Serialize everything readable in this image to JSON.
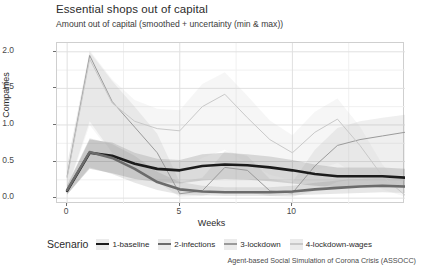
{
  "chart_data": {
    "type": "line",
    "title": "Essential shops out of capital",
    "subtitle": "Amount out of capital (smoothed + uncertainty (min & max))",
    "xlabel": "Weeks",
    "ylabel": "Companies",
    "caption": "Agent-based Social Simulation of Corona Crisis (ASSOCC)",
    "legend_title": "Scenario",
    "legend_position": "bottom",
    "grid": true,
    "xlim": [
      -0.45,
      15.0
    ],
    "ylim": [
      -0.08,
      2.12
    ],
    "xticks": [
      0,
      5,
      10
    ],
    "xtick_labels": [
      "0",
      "5",
      "10"
    ],
    "yticks": [
      0.0,
      0.5,
      1.0,
      1.5,
      2.0
    ],
    "ytick_labels": [
      "0.0",
      "0.5",
      "1.0",
      "1.5",
      "2.0"
    ],
    "x": [
      0,
      1,
      2,
      3,
      4,
      5,
      6,
      7,
      8,
      9,
      10,
      11,
      12,
      13,
      14,
      15
    ],
    "series": [
      {
        "name": "1-baseline",
        "color": "#1c1c1c",
        "width": 2.6,
        "values": [
          0.1,
          0.62,
          0.58,
          0.47,
          0.4,
          0.38,
          0.44,
          0.46,
          0.45,
          0.42,
          0.38,
          0.33,
          0.3,
          0.3,
          0.3,
          0.28
        ],
        "band_min": [
          0.05,
          0.4,
          0.34,
          0.26,
          0.22,
          0.2,
          0.24,
          0.26,
          0.25,
          0.23,
          0.2,
          0.17,
          0.15,
          0.15,
          0.15,
          0.14
        ],
        "band_max": [
          0.17,
          0.8,
          0.76,
          0.62,
          0.54,
          0.52,
          0.6,
          0.62,
          0.6,
          0.57,
          0.52,
          0.46,
          0.42,
          0.42,
          0.42,
          0.4
        ]
      },
      {
        "name": "2-infections",
        "color": "#6b6b6b",
        "width": 2.6,
        "values": [
          0.11,
          0.63,
          0.55,
          0.4,
          0.22,
          0.12,
          0.09,
          0.08,
          0.08,
          0.08,
          0.09,
          0.12,
          0.14,
          0.16,
          0.17,
          0.16
        ],
        "band_min": [
          0.05,
          0.42,
          0.33,
          0.21,
          0.11,
          0.05,
          0.04,
          0.03,
          0.03,
          0.03,
          0.04,
          0.05,
          0.06,
          0.07,
          0.08,
          0.07
        ],
        "band_max": [
          0.18,
          0.82,
          0.74,
          0.58,
          0.36,
          0.22,
          0.17,
          0.15,
          0.15,
          0.15,
          0.17,
          0.21,
          0.24,
          0.27,
          0.28,
          0.27
        ]
      },
      {
        "name": "3-lockdown",
        "color": "#9a9a9a",
        "width": 1.0,
        "values": [
          0.3,
          1.95,
          1.32,
          0.97,
          0.62,
          0.06,
          0.1,
          0.42,
          0.38,
          0.1,
          0.07,
          0.44,
          0.72,
          0.8,
          0.85,
          0.9
        ],
        "band_min": [
          0.12,
          1.05,
          0.62,
          0.4,
          0.22,
          0.02,
          0.03,
          0.1,
          0.08,
          0.03,
          0.02,
          0.1,
          0.22,
          0.28,
          0.3,
          0.32
        ],
        "band_max": [
          0.46,
          2.0,
          1.6,
          1.25,
          0.88,
          0.22,
          0.28,
          0.64,
          0.58,
          0.26,
          0.22,
          0.66,
          0.96,
          1.05,
          1.1,
          1.14
        ]
      },
      {
        "name": "4-lockdown-wages",
        "color": "#c9c9c9",
        "width": 1.0,
        "values": [
          0.28,
          1.9,
          1.3,
          1.05,
          0.95,
          0.92,
          1.25,
          1.42,
          1.1,
          0.8,
          0.62,
          0.9,
          1.08,
          0.72,
          0.3,
          0.04
        ],
        "band_min": [
          0.1,
          1.0,
          0.6,
          0.45,
          0.38,
          0.36,
          0.55,
          0.66,
          0.48,
          0.32,
          0.24,
          0.38,
          0.48,
          0.3,
          0.12,
          0.02
        ],
        "band_max": [
          0.44,
          2.02,
          1.62,
          1.34,
          1.22,
          1.2,
          1.56,
          1.72,
          1.4,
          1.06,
          0.86,
          1.18,
          1.36,
          0.98,
          0.46,
          0.1
        ]
      }
    ]
  }
}
